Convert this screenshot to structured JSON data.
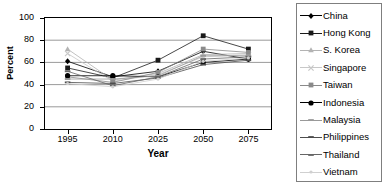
{
  "chart_data": {
    "type": "line",
    "title": "",
    "xlabel": "Year",
    "ylabel": "Percent",
    "categories": [
      "1995",
      "2010",
      "2025",
      "2050",
      "2075"
    ],
    "ylim": [
      0,
      100
    ],
    "yticks": [
      0,
      20,
      40,
      60,
      80,
      100
    ],
    "grid": true,
    "legend_position": "right",
    "series": [
      {
        "name": "China",
        "values": [
          61,
          47,
          52,
          70,
          63
        ],
        "color": "#000000",
        "marker": "diamond"
      },
      {
        "name": "Hong Kong",
        "values": [
          55,
          46,
          62,
          84,
          72
        ],
        "color": "#1a1a1a",
        "marker": "square"
      },
      {
        "name": "S. Korea",
        "values": [
          72,
          44,
          50,
          67,
          68
        ],
        "color": "#b3b3b3",
        "marker": "triangle"
      },
      {
        "name": "Singapore",
        "values": [
          68,
          43,
          49,
          65,
          67
        ],
        "color": "#c8c8c8",
        "marker": "cross"
      },
      {
        "name": "Taiwan",
        "values": [
          47,
          42,
          51,
          72,
          69
        ],
        "color": "#8a8a8a",
        "marker": "square"
      },
      {
        "name": "Indonesia",
        "values": [
          48,
          48,
          47,
          60,
          63
        ],
        "color": "#000000",
        "marker": "circle"
      },
      {
        "name": "Malaysia",
        "values": [
          45,
          45,
          48,
          66,
          66
        ],
        "color": "#999999",
        "marker": "dash"
      },
      {
        "name": "Philippines",
        "values": [
          42,
          41,
          46,
          58,
          62
        ],
        "color": "#4d4d4d",
        "marker": "dash"
      },
      {
        "name": "Thailand",
        "values": [
          52,
          39,
          47,
          63,
          65
        ],
        "color": "#666666",
        "marker": "dash"
      },
      {
        "name": "Vietnam",
        "values": [
          41,
          38,
          45,
          61,
          64
        ],
        "color": "#d0d0d0",
        "marker": "dot"
      }
    ]
  }
}
